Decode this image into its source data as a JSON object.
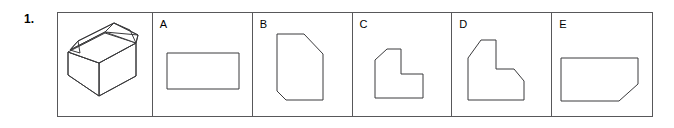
{
  "question": {
    "number_label": "1.",
    "prompt_type": "orthographic-projection-multiple-choice"
  },
  "stem": {
    "cell_label": "",
    "figure_name": "isometric-stepped-block",
    "description": "Isometric pictorial of a stepped block with chamfered top ridge"
  },
  "options": [
    {
      "letter": "A",
      "figure_name": "plain-rectangle",
      "description": "Plain rectangle, no internal lines"
    },
    {
      "letter": "B",
      "figure_name": "tall-hexagon",
      "description": "Tall vertical shape with chamfered top-right and bottom-left corners"
    },
    {
      "letter": "C",
      "figure_name": "small-l-shape-chamfer-top-left",
      "description": "L-shaped figure with chamfered top-left corner"
    },
    {
      "letter": "D",
      "figure_name": "large-l-shape-two-chamfers",
      "description": "L-shaped figure with chamfered top-left and chamfered step corner"
    },
    {
      "letter": "E",
      "figure_name": "rectangle-chamfer-bottom-right",
      "description": "Wide rectangle with chamfered bottom-right corner"
    }
  ],
  "colors": {
    "stroke": "#3a3a3c",
    "frame": "#58585a",
    "background": "#ffffff",
    "text": "#000000"
  }
}
